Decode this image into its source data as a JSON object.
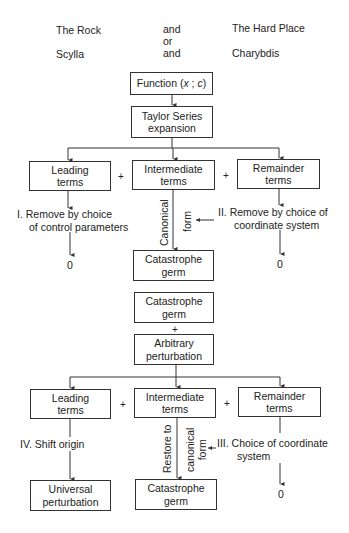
{
  "header": {
    "left_top": "The Rock",
    "mid_top": "and",
    "right_top": "The Hard Place",
    "mid_or": "or",
    "left_bottom": "Scylla",
    "mid_bottom": "and",
    "right_bottom": "Charybdis"
  },
  "part1": {
    "function_box": "Function (x ; c)",
    "function_prefix": "Function (",
    "function_x": "x",
    "function_sep": " ; ",
    "function_c": "c",
    "function_suffix": ")",
    "taylor_box": {
      "line1": "Taylor Series",
      "line2": "expansion"
    },
    "leading_box": {
      "line1": "Leading",
      "line2": "terms"
    },
    "intermediate_box": {
      "line1": "Intermediate",
      "line2": "terms"
    },
    "remainder_box": {
      "line1": "Remainder",
      "line2": "terms"
    },
    "plus1": "+",
    "plus2": "+",
    "step_I": {
      "line1": "I.  Remove by choice",
      "line2": "of control parameters"
    },
    "step_II": {
      "line1": "II.  Remove by choice of",
      "line2": "coordinate system"
    },
    "canonical_left": "Canonical",
    "canonical_right": "form",
    "zero_left": "0",
    "zero_right": "0",
    "germ_box": {
      "line1": "Catastrophe",
      "line2": "germ"
    }
  },
  "part2": {
    "germ_box": {
      "line1": "Catastrophe",
      "line2": "germ"
    },
    "plus_mid": "+",
    "perturbation_box": {
      "line1": "Arbitrary",
      "line2": "perturbation"
    },
    "leading_box": {
      "line1": "Leading",
      "line2": "terms"
    },
    "intermediate_box": {
      "line1": "Intermediate",
      "line2": "terms"
    },
    "remainder_box": {
      "line1": "Remainder",
      "line2": "terms"
    },
    "plus1": "+",
    "plus2": "+",
    "step_IV": "IV.  Shift origin",
    "step_III": {
      "line1": "III.  Choice of coordinate",
      "line2": "system"
    },
    "restore_left": "Restore to",
    "restore_right_1": "canonical",
    "restore_right_2": "form",
    "universal_box": {
      "line1": "Universal",
      "line2": "perturbation"
    },
    "germ_out_box": {
      "line1": "Catastrophe",
      "line2": "germ"
    },
    "zero_right": "0"
  }
}
